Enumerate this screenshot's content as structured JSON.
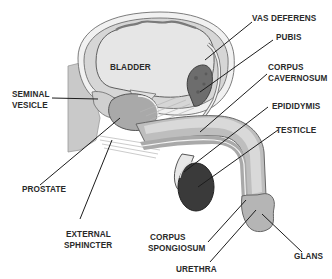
{
  "diagram": {
    "colors": {
      "background": "#ffffff",
      "bladder_fill": "#e4e4e4",
      "wall_fill": "#d2d2d2",
      "tissue_fill": "#bdbdbd",
      "pubis_fill": "#6d6d6d",
      "testicle_fill": "#3a3a3a",
      "label_text": "#2a2a2a",
      "leader_line": "#1c1c1c"
    },
    "labels": {
      "bladder": "BLADDER",
      "vas_deferens": "VAS DEFERENS",
      "pubis": "PUBIS",
      "corpus_cavernosum_1": "CORPUS",
      "corpus_cavernosum_2": "CAVERNOSUM",
      "seminal_vesicle_1": "SEMINAL",
      "seminal_vesicle_2": "VESICLE",
      "epididymis": "EPIDIDYMIS",
      "testicle": "TESTICLE",
      "prostate": "PROSTATE",
      "external_sphincter_1": "EXTERNAL",
      "external_sphincter_2": "SPHINCTER",
      "corpus_spongiosum_1": "CORPUS",
      "corpus_spongiosum_2": "SPONGIOSUM",
      "urethra": "URETHRA",
      "glans": "GLANS"
    }
  }
}
